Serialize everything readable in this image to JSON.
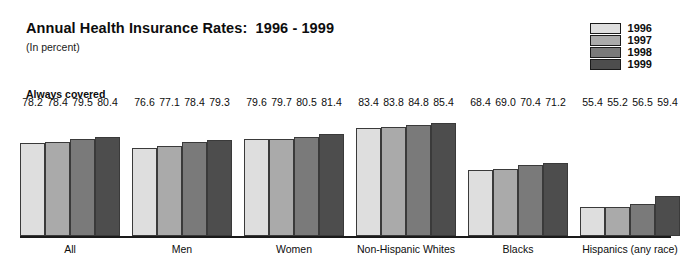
{
  "title": "Annual Health Insurance Rates:  1996 - 1999",
  "subtitle": "(In percent)",
  "section_label": "Always covered",
  "legend": {
    "entries": [
      {
        "label": "1996",
        "color": "#dedede"
      },
      {
        "label": "1997",
        "color": "#aaaaaa"
      },
      {
        "label": "1998",
        "color": "#7a7a7a"
      },
      {
        "label": "1999",
        "color": "#4d4d4d"
      }
    ]
  },
  "chart_data": {
    "type": "bar",
    "title": "Annual Health Insurance Rates:  1996 - 1999",
    "subtitle": "(In percent)",
    "section": "Always covered",
    "xlabel": "",
    "ylabel": "In percent",
    "ylim": [
      45,
      90
    ],
    "grid": false,
    "legend_position": "top-right",
    "categories": [
      "All",
      "Men",
      "Women",
      "Non-Hispanic Whites",
      "Blacks",
      "Hispanics (any race)"
    ],
    "series": [
      {
        "name": "1996",
        "color": "#dedede",
        "values": [
          78.2,
          76.6,
          79.6,
          83.4,
          68.4,
          55.4
        ]
      },
      {
        "name": "1997",
        "color": "#aaaaaa",
        "values": [
          78.4,
          77.1,
          79.7,
          83.8,
          69.0,
          55.2
        ]
      },
      {
        "name": "1998",
        "color": "#7a7a7a",
        "values": [
          79.5,
          78.4,
          80.5,
          84.8,
          70.4,
          56.5
        ]
      },
      {
        "name": "1999",
        "color": "#4d4d4d",
        "values": [
          80.4,
          79.3,
          81.4,
          85.4,
          71.2,
          59.4
        ]
      }
    ],
    "value_labels": [
      [
        "78.2",
        "78.4",
        "79.5",
        "80.4"
      ],
      [
        "76.6",
        "77.1",
        "78.4",
        "79.3"
      ],
      [
        "79.6",
        "79.7",
        "80.5",
        "81.4"
      ],
      [
        "83.4",
        "83.8",
        "84.8",
        "85.4"
      ],
      [
        "68.4",
        "69.0",
        "70.4",
        "71.2"
      ],
      [
        "55.4",
        "55.2",
        "56.5",
        "59.4"
      ]
    ]
  }
}
